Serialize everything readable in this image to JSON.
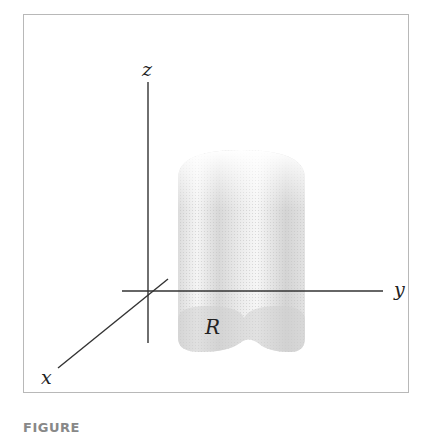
{
  "figure": {
    "axes": {
      "x_label": "x",
      "y_label": "y",
      "z_label": "z"
    },
    "region_label": "R",
    "solid": "translucent vertical cylinder-like solid over two-lobed base region R",
    "colors": {
      "axis": "#333333",
      "frame": "#b8b8b8",
      "solid_fill": "#d9d9d9"
    }
  },
  "caption": {
    "text": "FIGURE"
  }
}
